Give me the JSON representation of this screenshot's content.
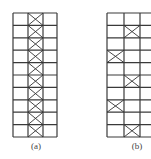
{
  "figure": {
    "panels": [
      {
        "label": "(a)",
        "description": "Frame with continuous bracing in middle bay",
        "columns": 3,
        "rows": 10,
        "braced_cells": [
          [
            0,
            1
          ],
          [
            1,
            1
          ],
          [
            2,
            1
          ],
          [
            3,
            1
          ],
          [
            4,
            1
          ],
          [
            5,
            1
          ],
          [
            6,
            1
          ],
          [
            7,
            1
          ],
          [
            8,
            1
          ],
          [
            9,
            1
          ]
        ]
      },
      {
        "label": "(b)",
        "description": "Frame with staggered bracing",
        "columns": 3,
        "rows": 10,
        "braced_cells": [
          [
            1,
            1
          ],
          [
            3,
            0
          ],
          [
            5,
            1
          ],
          [
            7,
            0
          ],
          [
            9,
            1
          ]
        ]
      }
    ],
    "line_color": "#3a3a3a",
    "brace_color": "#333333"
  }
}
